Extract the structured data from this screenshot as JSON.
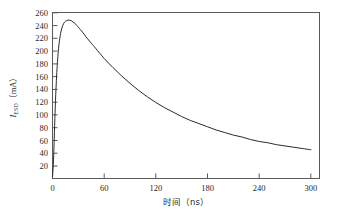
{
  "chart_data": {
    "type": "line",
    "title": "",
    "subtitle": "",
    "xlabel": "时间（ns）",
    "ylabel": "I_ESD (mA)",
    "ylabel_symbol": "I",
    "ylabel_subscript": "ESD",
    "ylabel_unit": "（mA）",
    "xlabel_name": "时间",
    "xlabel_unit": "（ns）",
    "xlim": [
      0,
      310
    ],
    "ylim": [
      0,
      260
    ],
    "xticks": [
      0,
      60,
      120,
      180,
      240,
      300
    ],
    "xtick_labels": [
      "0",
      "60",
      "120",
      "180",
      "240",
      "300"
    ],
    "yticks": [
      20,
      40,
      60,
      80,
      100,
      120,
      140,
      160,
      180,
      200,
      220,
      240,
      260
    ],
    "ytick_labels": [
      "20",
      "40",
      "60",
      "80",
      "100",
      "120",
      "140",
      "160",
      "180",
      "200",
      "220",
      "240",
      "260"
    ],
    "grid": false,
    "legend": false,
    "legend_position": "none",
    "frame": "box",
    "series": [
      {
        "name": "ESD current waveform",
        "color": "#2b2b2b",
        "x": [
          0,
          1,
          2,
          3,
          4,
          5,
          6,
          7,
          8,
          9,
          10,
          12,
          14,
          16,
          18,
          20,
          22,
          24,
          26,
          28,
          30,
          35,
          40,
          45,
          50,
          60,
          70,
          80,
          90,
          100,
          110,
          120,
          130,
          140,
          150,
          160,
          170,
          180,
          190,
          200,
          210,
          220,
          230,
          240,
          250,
          260,
          270,
          280,
          290,
          300
        ],
        "y": [
          3,
          22,
          62,
          104,
          139,
          166,
          187,
          203,
          215,
          224,
          231,
          240,
          245,
          247,
          248,
          248,
          247,
          245,
          243,
          240,
          237,
          229,
          220,
          212,
          204,
          188,
          174,
          161,
          149,
          138,
          128,
          119,
          111,
          104,
          97,
          91,
          86,
          81,
          76,
          72,
          68,
          65,
          61,
          58,
          56,
          53,
          51,
          49,
          47,
          45
        ]
      }
    ],
    "peak": {
      "x": 20,
      "y": 248
    },
    "endpoint": {
      "x": 300,
      "y": 45
    }
  },
  "figure": {
    "background_color": "#ffffff",
    "axis_color": "#5a5a5a",
    "curve_color": "#2b2b2b"
  }
}
